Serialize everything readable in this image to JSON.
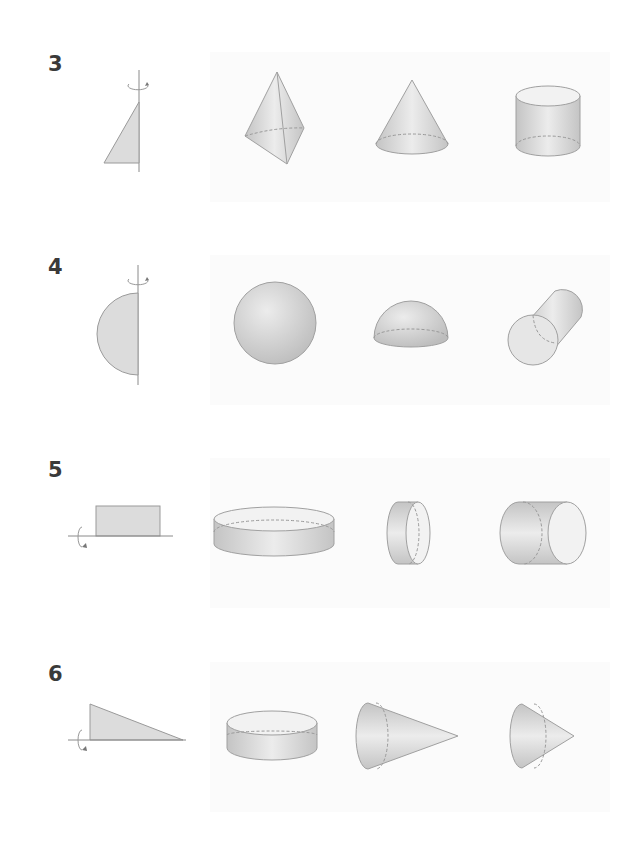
{
  "problems": [
    {
      "number": "3",
      "figure": "right-triangle-vertical-axis",
      "options": [
        "triangular-pyramid",
        "cone",
        "cylinder"
      ]
    },
    {
      "number": "4",
      "figure": "semicircle-vertical-axis",
      "options": [
        "sphere",
        "hemisphere",
        "tilted-cylinder"
      ]
    },
    {
      "number": "5",
      "figure": "rectangle-horizontal-axis",
      "options": [
        "flat-cylinder-disk",
        "narrow-horizontal-cylinder",
        "wide-horizontal-cylinder"
      ]
    },
    {
      "number": "6",
      "figure": "right-triangle-horizontal-axis",
      "options": [
        "flat-cylinder",
        "horizontal-cone-large",
        "horizontal-cone-small"
      ]
    }
  ],
  "colors": {
    "shape_fill": "#d9d9d9",
    "shape_stroke": "#9a9a9a",
    "top_face": "#f2f2f2",
    "axis": "#8a8a8a",
    "label": "#3a3a3a"
  }
}
